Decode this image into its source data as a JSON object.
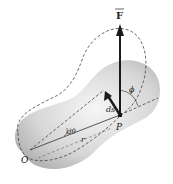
{
  "diagram": {
    "labels": {
      "force": "F",
      "displacement": "ds",
      "angle_phi": "ϕ",
      "angle_dtheta": "dθ",
      "radius": "r",
      "origin": "O",
      "point": "P"
    },
    "colors": {
      "body_fill": "#c8c8c8",
      "body_light": "#f4f4f4",
      "line": "#333333",
      "arrow": "#1a1a1a"
    }
  }
}
